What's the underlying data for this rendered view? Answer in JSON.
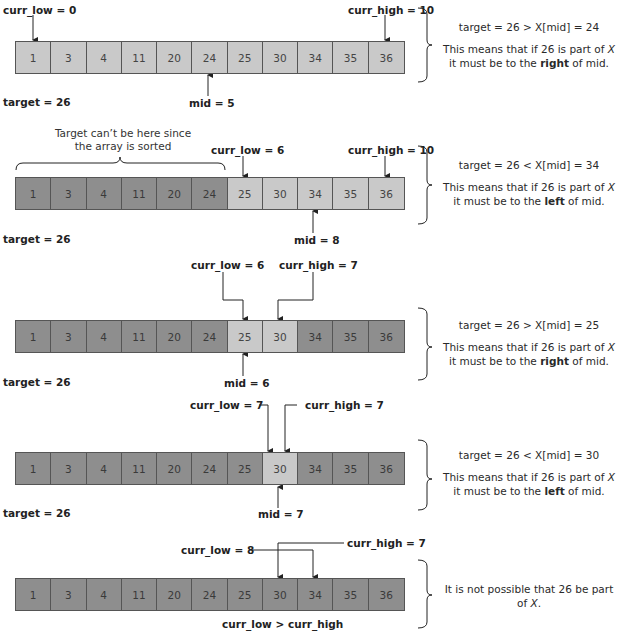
{
  "array_values": [
    1,
    3,
    4,
    11,
    20,
    24,
    25,
    30,
    34,
    35,
    36
  ],
  "colors": {
    "active_cell": "#c9c9c9",
    "excluded_cell": "#8e8e8e",
    "border": "#555555"
  },
  "steps": [
    {
      "curr_low_label": "curr_low = 0",
      "curr_high_label": "curr_high = 10",
      "mid_label": "mid = 5",
      "target_label": "target = 26",
      "active_range": [
        0,
        10
      ],
      "comparison": "target = 26 > X[mid] = 24",
      "explanation_pre": "This means that if 26 is part of ",
      "explanation_var": "X",
      "explanation_mid": " it must be to the ",
      "explanation_dir": "right",
      "explanation_post": " of mid."
    },
    {
      "excluded_note": "Target can’t be here since the array is sorted",
      "curr_low_label": "curr_low = 6",
      "curr_high_label": "curr_high = 10",
      "mid_label": "mid = 8",
      "target_label": "target = 26",
      "active_range": [
        6,
        10
      ],
      "comparison": "target = 26 < X[mid] = 34",
      "explanation_pre": "This means that if 26 is part of ",
      "explanation_var": "X",
      "explanation_mid": " it must be to the ",
      "explanation_dir": "left",
      "explanation_post": " of mid."
    },
    {
      "curr_low_label": "curr_low = 6",
      "curr_high_label": "curr_high = 7",
      "mid_label": "mid = 6",
      "target_label": "target = 26",
      "active_range": [
        6,
        7
      ],
      "comparison": "target = 26 > X[mid] = 25",
      "explanation_pre": "This means that if 26 is part of ",
      "explanation_var": "X",
      "explanation_mid": " it must be to the ",
      "explanation_dir": "right",
      "explanation_post": " of mid."
    },
    {
      "curr_low_label": "curr_low = 7",
      "curr_high_label": "curr_high = 7",
      "mid_label": "mid = 7",
      "target_label": "target = 26",
      "active_range": [
        7,
        7
      ],
      "comparison": "target = 26 < X[mid] = 30",
      "explanation_pre": "This means that if 26 is part of ",
      "explanation_var": "X",
      "explanation_mid": " it must be to the ",
      "explanation_dir": "left",
      "explanation_post": " of mid."
    },
    {
      "curr_low_label": "curr_low = 8",
      "curr_high_label": "curr_high = 7",
      "condition_label": "curr_low > curr_high",
      "active_range": null,
      "conclusion_pre": "It is not possible that 26 be part of ",
      "conclusion_var": "X",
      "conclusion_post": "."
    }
  ]
}
